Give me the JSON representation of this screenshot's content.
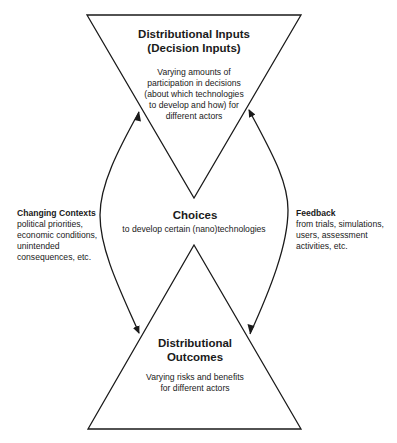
{
  "diagram": {
    "top_node": {
      "title_lines": [
        "Distributional Inputs",
        "(Decision Inputs)"
      ],
      "body_lines": [
        "Varying amounts of",
        "participation in decisions",
        "(about which technologies",
        "to develop and how) for",
        "different actors"
      ]
    },
    "center_node": {
      "title": "Choices",
      "body": "to develop certain (nano)technologies"
    },
    "bottom_node": {
      "title_lines": [
        "Distributional",
        "Outcomes"
      ],
      "body_lines": [
        "Varying risks and benefits",
        "for different actors"
      ]
    },
    "left_label": {
      "title": "Changing Contexts",
      "body_lines": [
        "political priorities,",
        "economic conditions,",
        "unintended",
        "consequences, etc."
      ]
    },
    "right_label": {
      "title": "Feedback",
      "body_lines": [
        "from trials, simulations,",
        "users, assessment",
        "activities, etc."
      ]
    },
    "arrows": [
      {
        "name": "left-bidirectional-arrow",
        "from": "top_node",
        "to": "bottom_node",
        "label": "left_label"
      },
      {
        "name": "right-bidirectional-arrow",
        "from": "bottom_node",
        "to": "top_node",
        "label": "right_label"
      }
    ],
    "colors": {
      "stroke": "#1a1a1a",
      "background": "#ffffff"
    }
  }
}
